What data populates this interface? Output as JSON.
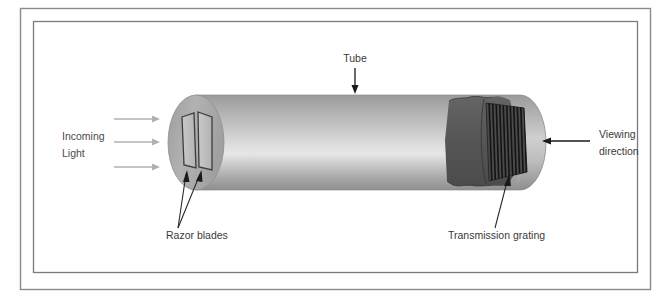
{
  "figure": {
    "type": "technical-illustration",
    "background_color": "#ffffff"
  },
  "frame": {
    "outer_border_color": "#8a8a8a",
    "inner_border_color": "#7a7a7a"
  },
  "labels": {
    "tube": "Tube",
    "incoming_light_line1": "Incoming",
    "incoming_light_line2": "Light",
    "razor_blades": "Razor blades",
    "transmission_grating": "Transmission grating",
    "viewing_direction_line1": "Viewing",
    "viewing_direction_line2": "direction"
  },
  "colors": {
    "tube_light": "#e8e8e8",
    "tube_mid": "#b4b4b4",
    "tube_dark": "#8f8f8f",
    "endcap_gray": "#a9a9a9",
    "cutaway_dark": "#585858",
    "grating_dark": "#4a4a4a",
    "grating_stripe": "#1e1e1e",
    "blade_fill": "#c2c2c2",
    "blade_outline": "#3c3c3c",
    "arrow_black": "#1a1a1a",
    "arrow_light": "#b0b0b0",
    "leader_line": "#2b2b2b",
    "text": "#3a3a3a"
  },
  "components": {
    "tube": {
      "name": "cylindrical tube body",
      "orientation": "horizontal"
    },
    "razor_blades": {
      "name": "razor blades",
      "count": 2,
      "location": "left aperture of tube"
    },
    "transmission_grating": {
      "name": "transmission grating",
      "stripe_count": 12,
      "location": "right end inside tube"
    },
    "incoming_light": {
      "name": "incoming light rays",
      "arrow_count": 3,
      "direction": "left-to-right"
    },
    "viewing_direction": {
      "name": "viewing direction arrow",
      "direction": "right-to-left"
    }
  }
}
